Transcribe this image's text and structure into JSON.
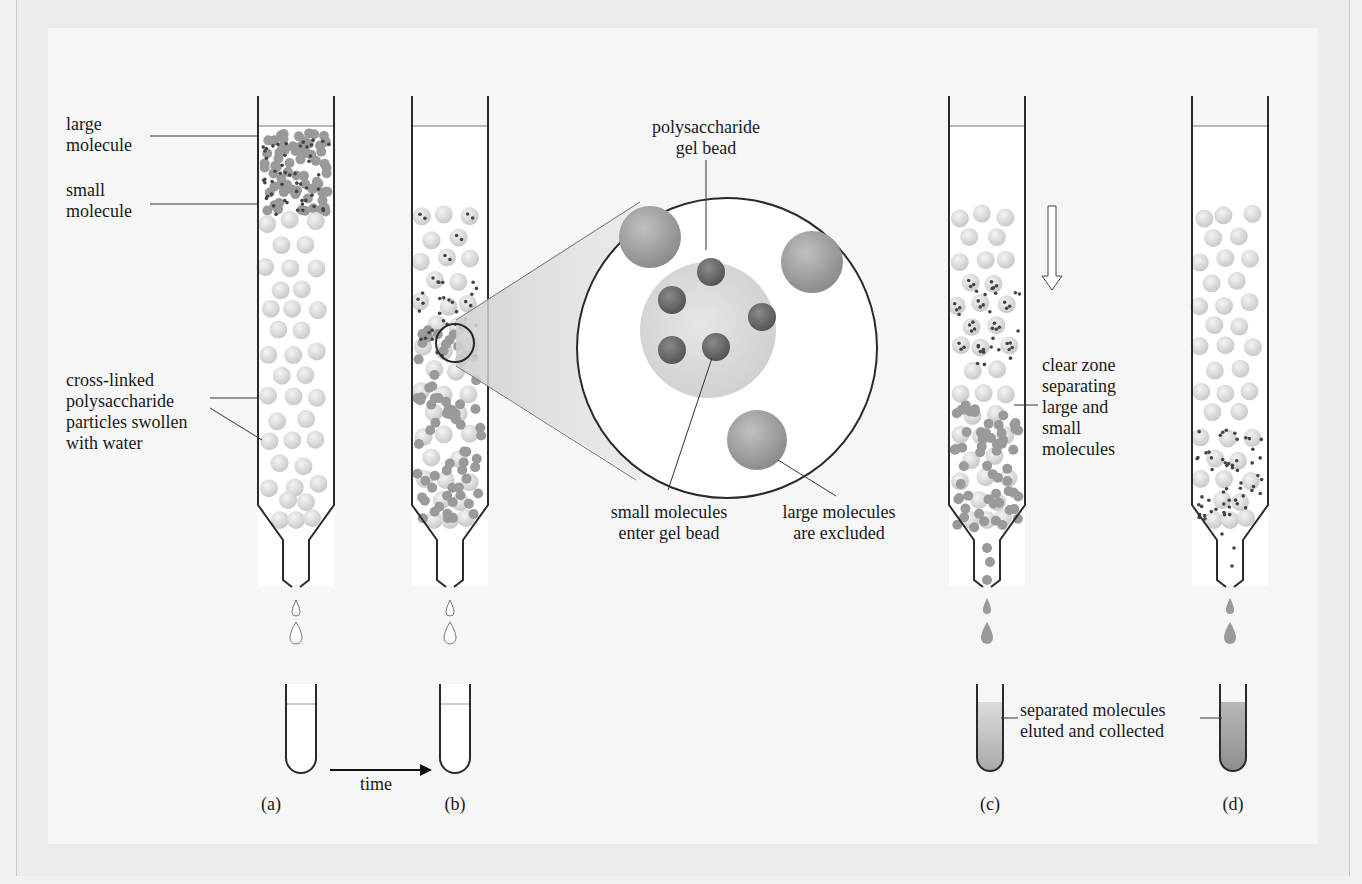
{
  "figure": {
    "panels": [
      {
        "id": "a",
        "label": "(a)"
      },
      {
        "id": "b",
        "label": "(b)"
      },
      {
        "id": "c",
        "label": "(c)"
      },
      {
        "id": "d",
        "label": "(d)"
      }
    ],
    "labels": {
      "large_molecule": "large\nmolecule",
      "small_molecule": "small\nmolecule",
      "cross_linked": "cross-linked\npolysaccharide\nparticles swollen\nwith water",
      "gel_bead": "polysaccharide\ngel bead",
      "small_enter": "small molecules\nenter gel bead",
      "large_excluded": "large molecules\nare excluded",
      "clear_zone": "clear zone\nseparating\nlarge and\nsmall\nmolecules",
      "separated": "separated molecules\neluted and collected",
      "time": "time"
    },
    "colors": {
      "page": "#f6f6f6",
      "outline": "#2a2a2a",
      "gel_bead": "#d8d8d8",
      "large_molecule": "#9a9a9a",
      "small_molecule": "#555555",
      "eluate": "#b0b0b0"
    }
  }
}
